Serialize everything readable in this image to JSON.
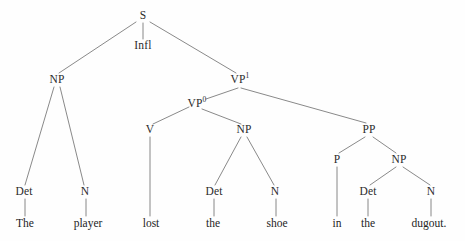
{
  "diagram": {
    "type": "syntax-tree",
    "sentence": "The player lost the shoe in the dugout.",
    "colors": {
      "background": "#fefefe",
      "edge": "#7c7c7c",
      "node_text": "#2b2b2b",
      "terminal_text": "#242424"
    },
    "nodes": [
      {
        "id": "s",
        "label": "S",
        "sup": "",
        "x": 143,
        "y": 16
      },
      {
        "id": "infl",
        "label": "Infl",
        "sup": "",
        "x": 143,
        "y": 46
      },
      {
        "id": "np1",
        "label": "NP",
        "sup": "",
        "x": 57,
        "y": 80
      },
      {
        "id": "vp1",
        "label": "VP",
        "sup": "1",
        "x": 240,
        "y": 80
      },
      {
        "id": "vp0",
        "label": "VP",
        "sup": "0",
        "x": 197,
        "y": 104
      },
      {
        "id": "v",
        "label": "V",
        "sup": "",
        "x": 150,
        "y": 130
      },
      {
        "id": "np2",
        "label": "NP",
        "sup": "",
        "x": 244,
        "y": 130
      },
      {
        "id": "pp",
        "label": "PP",
        "sup": "",
        "x": 369,
        "y": 130
      },
      {
        "id": "det1",
        "label": "Det",
        "sup": "",
        "x": 24,
        "y": 192
      },
      {
        "id": "n1",
        "label": "N",
        "sup": "",
        "x": 85,
        "y": 192
      },
      {
        "id": "det2",
        "label": "Det",
        "sup": "",
        "x": 214,
        "y": 192
      },
      {
        "id": "n2",
        "label": "N",
        "sup": "",
        "x": 275,
        "y": 192
      },
      {
        "id": "p",
        "label": "P",
        "sup": "",
        "x": 337,
        "y": 160
      },
      {
        "id": "np3",
        "label": "NP",
        "sup": "",
        "x": 399,
        "y": 160
      },
      {
        "id": "det3",
        "label": "Det",
        "sup": "",
        "x": 368,
        "y": 192
      },
      {
        "id": "n3",
        "label": "N",
        "sup": "",
        "x": 431,
        "y": 192
      }
    ],
    "terminals": [
      {
        "id": "w-the1",
        "label": "The",
        "x": 25,
        "y": 224
      },
      {
        "id": "w-player",
        "label": "player",
        "x": 88,
        "y": 224
      },
      {
        "id": "w-lost",
        "label": "lost",
        "x": 151,
        "y": 224
      },
      {
        "id": "w-the2",
        "label": "the",
        "x": 213,
        "y": 224
      },
      {
        "id": "w-shoe",
        "label": "shoe",
        "x": 277,
        "y": 224
      },
      {
        "id": "w-in",
        "label": "in",
        "x": 337,
        "y": 224
      },
      {
        "id": "w-the3",
        "label": "the",
        "x": 368,
        "y": 224
      },
      {
        "id": "w-dugout",
        "label": "dugout.",
        "x": 429,
        "y": 224
      }
    ],
    "edges": [
      {
        "id": "e-s-np1",
        "from": "s",
        "to": "np1",
        "x1": 136,
        "y1": 22,
        "x2": 59,
        "y2": 73
      },
      {
        "id": "e-s-infl",
        "from": "s",
        "to": "infl",
        "x1": 143,
        "y1": 23,
        "x2": 143,
        "y2": 39
      },
      {
        "id": "e-s-vp1",
        "from": "s",
        "to": "vp1",
        "x1": 150,
        "y1": 22,
        "x2": 236,
        "y2": 73
      },
      {
        "id": "e-vp1-vp0",
        "from": "vp1",
        "to": "vp0",
        "x1": 238,
        "y1": 88,
        "x2": 206,
        "y2": 99
      },
      {
        "id": "e-vp1-pp",
        "from": "vp1",
        "to": "pp",
        "x1": 241,
        "y1": 88,
        "x2": 366,
        "y2": 123
      },
      {
        "id": "e-vp0-v",
        "from": "vp0",
        "to": "v",
        "x1": 189,
        "y1": 107,
        "x2": 153,
        "y2": 124
      },
      {
        "id": "e-vp0-np2",
        "from": "vp0",
        "to": "np2",
        "x1": 202,
        "y1": 109,
        "x2": 241,
        "y2": 124
      },
      {
        "id": "e-np1-det1",
        "from": "np1",
        "to": "det1",
        "x1": 54,
        "y1": 87,
        "x2": 25,
        "y2": 185
      },
      {
        "id": "e-np1-n1",
        "from": "np1",
        "to": "n1",
        "x1": 60,
        "y1": 87,
        "x2": 84,
        "y2": 185
      },
      {
        "id": "e-v-lost",
        "from": "v",
        "to": "w-lost",
        "x1": 150,
        "y1": 137,
        "x2": 150,
        "y2": 216
      },
      {
        "id": "e-np2-det2",
        "from": "np2",
        "to": "det2",
        "x1": 241,
        "y1": 137,
        "x2": 215,
        "y2": 185
      },
      {
        "id": "e-np2-n2",
        "from": "np2",
        "to": "n2",
        "x1": 247,
        "y1": 137,
        "x2": 274,
        "y2": 185
      },
      {
        "id": "e-pp-p",
        "from": "pp",
        "to": "p",
        "x1": 365,
        "y1": 137,
        "x2": 339,
        "y2": 153
      },
      {
        "id": "e-pp-np3",
        "from": "pp",
        "to": "np3",
        "x1": 373,
        "y1": 137,
        "x2": 396,
        "y2": 153
      },
      {
        "id": "e-p-in",
        "from": "p",
        "to": "w-in",
        "x1": 337,
        "y1": 167,
        "x2": 337,
        "y2": 216
      },
      {
        "id": "e-np3-det3",
        "from": "np3",
        "to": "det3",
        "x1": 396,
        "y1": 167,
        "x2": 370,
        "y2": 185
      },
      {
        "id": "e-np3-n3",
        "from": "np3",
        "to": "n3",
        "x1": 403,
        "y1": 167,
        "x2": 430,
        "y2": 185
      },
      {
        "id": "e-det1-the",
        "from": "det1",
        "to": "w-the1",
        "x1": 25,
        "y1": 199,
        "x2": 25,
        "y2": 216
      },
      {
        "id": "e-n1-player",
        "from": "n1",
        "to": "w-player",
        "x1": 86,
        "y1": 199,
        "x2": 86,
        "y2": 216
      },
      {
        "id": "e-det2-the",
        "from": "det2",
        "to": "w-the2",
        "x1": 214,
        "y1": 199,
        "x2": 214,
        "y2": 216
      },
      {
        "id": "e-n2-shoe",
        "from": "n2",
        "to": "w-shoe",
        "x1": 276,
        "y1": 199,
        "x2": 276,
        "y2": 216
      },
      {
        "id": "e-det3-the",
        "from": "det3",
        "to": "w-the3",
        "x1": 368,
        "y1": 199,
        "x2": 368,
        "y2": 216
      },
      {
        "id": "e-n3-dugout",
        "from": "n3",
        "to": "w-dugout",
        "x1": 431,
        "y1": 199,
        "x2": 431,
        "y2": 216
      }
    ]
  }
}
